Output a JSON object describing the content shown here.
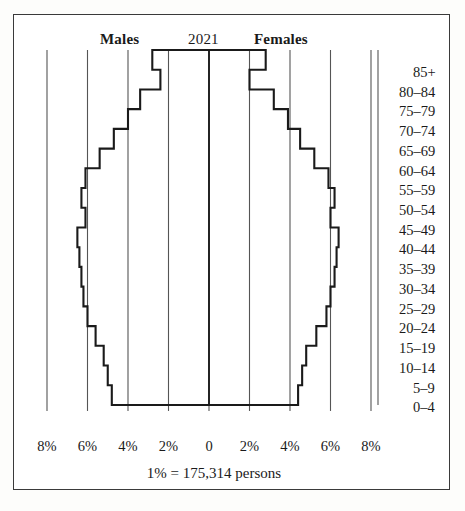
{
  "header": {
    "males_label": "Males",
    "year_label": "2021",
    "females_label": "Females"
  },
  "caption": "1% = 175,314 persons",
  "axis": {
    "tick_labels": [
      "8%",
      "6%",
      "4%",
      "2%",
      "0",
      "2%",
      "4%",
      "6%",
      "8%"
    ],
    "tick_values": [
      -8,
      -6,
      -4,
      -2,
      0,
      2,
      4,
      6,
      8
    ]
  },
  "age_labels": [
    "85+",
    "80–84",
    "75–79",
    "70–74",
    "65–69",
    "60–64",
    "55–59",
    "50–54",
    "45–49",
    "40–44",
    "35–39",
    "30–34",
    "25–29",
    "20–24",
    "15–19",
    "10–14",
    "5–9",
    "0–4"
  ],
  "colors": {
    "outline": "#1a1a1a",
    "gridline": "#555555",
    "frame": "#3a3a3a",
    "background": "#ffffff"
  },
  "chart_data": {
    "type": "bar",
    "orientation": "population-pyramid",
    "title": "2021",
    "xlabel": "",
    "ylabel": "",
    "xlim": [
      -8,
      8
    ],
    "grid": true,
    "legend_position": "top",
    "unit": "percent of total population",
    "scale_note": "1% = 175,314 persons",
    "categories": [
      "85+",
      "80–84",
      "75–79",
      "70–74",
      "65–69",
      "60–64",
      "55–59",
      "50–54",
      "45–49",
      "40–44",
      "35–39",
      "30–34",
      "25–29",
      "20–24",
      "15–19",
      "10–14",
      "5–9",
      "0–4"
    ],
    "series": [
      {
        "name": "Males",
        "values": [
          2.8,
          2.4,
          3.4,
          4.0,
          4.7,
          5.4,
          6.1,
          6.3,
          6.1,
          6.5,
          6.4,
          6.3,
          6.2,
          6.0,
          5.6,
          5.2,
          5.0,
          4.8
        ]
      },
      {
        "name": "Females",
        "values": [
          2.8,
          2.0,
          3.2,
          3.9,
          4.5,
          5.2,
          5.9,
          6.2,
          6.0,
          6.4,
          6.3,
          6.2,
          6.0,
          5.8,
          5.3,
          4.8,
          4.6,
          4.4
        ]
      }
    ]
  }
}
